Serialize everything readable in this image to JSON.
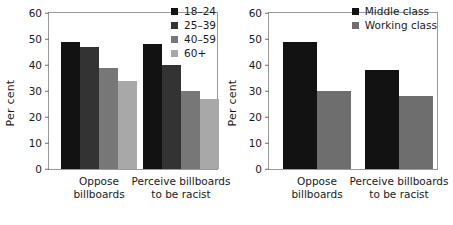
{
  "chart_data": [
    {
      "panel": "left",
      "type": "bar",
      "title": "",
      "xlabel": "",
      "ylabel": "Per cent",
      "ylim": [
        0,
        60
      ],
      "yticks": [
        0,
        10,
        20,
        30,
        40,
        50,
        60
      ],
      "grid": false,
      "legend_position": "top-right",
      "categories": [
        "Oppose billboards",
        "Perceive billboards to be racist"
      ],
      "category_lines": [
        [
          "Oppose",
          "billboards"
        ],
        [
          "Perceive billboards",
          "to be racist"
        ]
      ],
      "series": [
        {
          "name": "18–24",
          "color": "#121212",
          "values": [
            49,
            48
          ]
        },
        {
          "name": "25–39",
          "color": "#333333",
          "values": [
            47,
            40
          ]
        },
        {
          "name": "40–59",
          "color": "#777777",
          "values": [
            39,
            30
          ]
        },
        {
          "name": "60+",
          "color": "#a8a8a8",
          "values": [
            34,
            27
          ]
        }
      ]
    },
    {
      "panel": "right",
      "type": "bar",
      "title": "",
      "xlabel": "",
      "ylabel": "Per cent",
      "ylim": [
        0,
        60
      ],
      "yticks": [
        0,
        10,
        20,
        30,
        40,
        50,
        60
      ],
      "grid": false,
      "legend_position": "top-right",
      "categories": [
        "Oppose billboards",
        "Perceive billboards to be racist"
      ],
      "category_lines": [
        [
          "Oppose",
          "billboards"
        ],
        [
          "Perceive billboards",
          "to be racist"
        ]
      ],
      "series": [
        {
          "name": "Middle class",
          "color": "#121212",
          "values": [
            49,
            38
          ]
        },
        {
          "name": "Working class",
          "color": "#6e6e6e",
          "values": [
            30,
            28
          ]
        }
      ]
    }
  ]
}
